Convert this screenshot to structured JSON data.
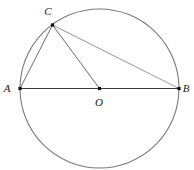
{
  "figure": {
    "width": 194,
    "height": 170,
    "background_color": "#ffffff"
  },
  "geometry": {
    "circle": {
      "center": {
        "x": 99.5,
        "y": 88.5
      },
      "radius": 79.5,
      "stroke_color": "#7a7a7a",
      "stroke_width": 1.1
    },
    "points": [
      {
        "id": "A",
        "label": "A",
        "x": 20.0,
        "y": 88.5,
        "marker": "square",
        "label_x": 7,
        "label_y": 88
      },
      {
        "id": "B",
        "label": "B",
        "x": 179.0,
        "y": 88.5,
        "marker": "square",
        "label_x": 186,
        "label_y": 88
      },
      {
        "id": "C",
        "label": "C",
        "x": 52.5,
        "y": 25.0,
        "marker": "square",
        "label_x": 48,
        "label_y": 11
      },
      {
        "id": "O",
        "label": "O",
        "x": 99.5,
        "y": 88.5,
        "marker": "square",
        "label_x": 99,
        "label_y": 102
      }
    ],
    "segments": [
      {
        "id": "AB",
        "from": "A",
        "to": "B",
        "stroke_color": "#3c3c3c",
        "stroke_width": 1.2
      },
      {
        "id": "CA",
        "from": "C",
        "to": "A",
        "stroke_color": "#6e6e6e",
        "stroke_width": 1.0
      },
      {
        "id": "CO",
        "from": "C",
        "to": "O",
        "stroke_color": "#6e6e6e",
        "stroke_width": 1.0
      },
      {
        "id": "CB",
        "from": "C",
        "to": "B",
        "stroke_color": "#8a8a8a",
        "stroke_width": 0.9
      }
    ],
    "marker": {
      "size": 3.2,
      "fill_color": "#111111"
    }
  },
  "labels": {
    "A": "A",
    "B": "B",
    "C": "C",
    "O": "O"
  }
}
